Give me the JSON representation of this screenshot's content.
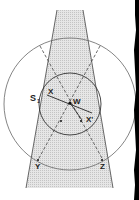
{
  "diagram": {
    "labels": {
      "s1": "S",
      "s1_sub": "1",
      "x": "X",
      "w": "W",
      "x_prime": "X'",
      "y": "Y",
      "z": "Z"
    },
    "colors": {
      "line": "#555555",
      "beam_fill": "#d8d8d8",
      "edge_border": "#000000",
      "background": "#ffffff"
    },
    "elements": [
      "shaded-beam",
      "large-circle",
      "small-circle",
      "dashed-line-left",
      "dashed-line-right",
      "axis-line-x-xprime"
    ]
  }
}
